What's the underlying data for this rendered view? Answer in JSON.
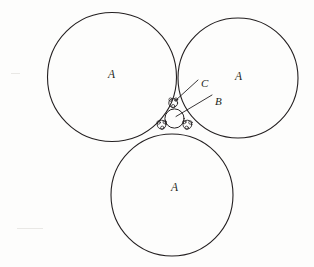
{
  "figure": {
    "background_color": "#fdfdfc",
    "ink_color": "#231f20",
    "stroke_width": 1.1,
    "canvas": {
      "width": 314,
      "height": 267
    }
  },
  "labels": {
    "a_top_left": "A",
    "a_top_right": "A",
    "a_bottom": "A",
    "b": "B",
    "c": "C"
  },
  "label_positions": {
    "a_top_left": {
      "x": 108,
      "y": 69
    },
    "a_top_right": {
      "x": 235,
      "y": 71
    },
    "a_bottom": {
      "x": 171,
      "y": 182
    },
    "b": {
      "x": 215,
      "y": 96
    },
    "c": {
      "x": 201,
      "y": 78
    }
  },
  "chart_data": {
    "type": "scatter",
    "xlabel": "",
    "ylabel": "",
    "xlim": [
      0,
      314
    ],
    "ylim": [
      0,
      267
    ],
    "grid": false,
    "legend": "none",
    "circles": [
      {
        "name": "A-top-left",
        "label": "A",
        "cx": 112.0,
        "cy": 77.0,
        "r": 64.5,
        "group": "outer"
      },
      {
        "name": "A-top-right",
        "label": "A",
        "cx": 238.0,
        "cy": 78.0,
        "r": 60.0,
        "group": "outer"
      },
      {
        "name": "A-bottom",
        "label": "A",
        "cx": 172.0,
        "cy": 195.0,
        "r": 61.0,
        "group": "outer"
      },
      {
        "name": "B-inner",
        "label": "B",
        "cx": 174.5,
        "cy": 118.5,
        "r": 9.6,
        "group": "soddy"
      },
      {
        "name": "C-top",
        "label": "C",
        "cx": 173.2,
        "cy": 103.0,
        "r": 4.4,
        "group": "corner"
      },
      {
        "name": "C-left",
        "label": "C",
        "cx": 161.6,
        "cy": 124.6,
        "r": 4.4,
        "group": "corner"
      },
      {
        "name": "C-right",
        "label": "C",
        "cx": 187.4,
        "cy": 124.6,
        "r": 4.4,
        "group": "corner"
      },
      {
        "name": "D-top-a",
        "label": "",
        "cx": 170.6,
        "cy": 99.6,
        "r": 1.7,
        "group": "tiny"
      },
      {
        "name": "D-top-b",
        "label": "",
        "cx": 176.0,
        "cy": 99.6,
        "r": 1.7,
        "group": "tiny"
      },
      {
        "name": "D-top-c",
        "label": "",
        "cx": 173.2,
        "cy": 106.2,
        "r": 1.7,
        "group": "tiny"
      },
      {
        "name": "D-left-a",
        "label": "",
        "cx": 158.6,
        "cy": 122.5,
        "r": 1.7,
        "group": "tiny"
      },
      {
        "name": "D-left-b",
        "label": "",
        "cx": 162.3,
        "cy": 127.8,
        "r": 1.7,
        "group": "tiny"
      },
      {
        "name": "D-left-c",
        "label": "",
        "cx": 164.7,
        "cy": 122.0,
        "r": 1.7,
        "group": "tiny"
      },
      {
        "name": "D-right-a",
        "label": "",
        "cx": 190.4,
        "cy": 122.5,
        "r": 1.7,
        "group": "tiny"
      },
      {
        "name": "D-right-b",
        "label": "",
        "cx": 186.7,
        "cy": 127.8,
        "r": 1.7,
        "group": "tiny"
      },
      {
        "name": "D-right-c",
        "label": "",
        "cx": 184.3,
        "cy": 122.0,
        "r": 1.7,
        "group": "tiny"
      }
    ],
    "leaders": [
      {
        "name": "leader-c",
        "from": {
          "x": 198,
          "y": 80
        },
        "to": {
          "x": 175.5,
          "y": 100.5
        }
      },
      {
        "name": "leader-b",
        "from": {
          "x": 212,
          "y": 95
        },
        "to": {
          "x": 176.0,
          "y": 116.5
        }
      }
    ]
  }
}
